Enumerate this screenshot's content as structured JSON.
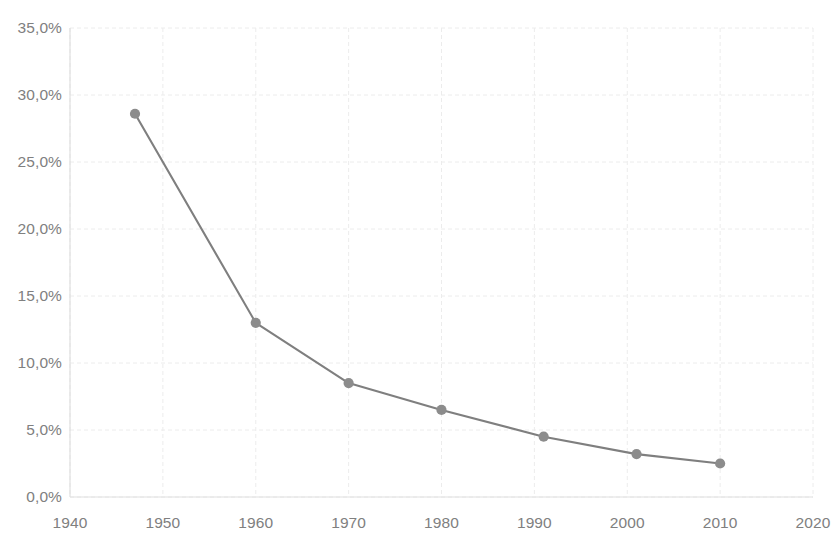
{
  "chart_data": {
    "type": "line",
    "title": "",
    "subtitle": "",
    "xlabel": "",
    "ylabel": "",
    "x": [
      1947,
      1960,
      1970,
      1980,
      1991,
      2001,
      2010
    ],
    "values": [
      28.6,
      13.0,
      8.5,
      6.5,
      4.5,
      3.2,
      2.5
    ],
    "series": [
      {
        "name": "",
        "x": [
          1947,
          1960,
          1970,
          1980,
          1991,
          2001,
          2010
        ],
        "values": [
          28.6,
          13.0,
          8.5,
          6.5,
          4.5,
          3.2,
          2.5
        ]
      }
    ],
    "xlim": [
      1940,
      2020
    ],
    "ylim": [
      0,
      35
    ],
    "x_tick_labels": [
      "1940",
      "1950",
      "1960",
      "1970",
      "1980",
      "1990",
      "2000",
      "2010",
      "2020"
    ],
    "x_tick_values": [
      1940,
      1950,
      1960,
      1970,
      1980,
      1990,
      2000,
      2010,
      2020
    ],
    "y_tick_labels": [
      "0,0%",
      "5,0%",
      "10,0%",
      "15,0%",
      "20,0%",
      "25,0%",
      "30,0%",
      "35,0%"
    ],
    "y_tick_values": [
      0,
      5,
      10,
      15,
      20,
      25,
      30,
      35
    ],
    "grid": true,
    "grid_style": "dashed",
    "legend": false,
    "legend_position": "none",
    "annotations": [],
    "colors": {
      "line": "#7f7f7f",
      "marker": "#8c8c8c",
      "grid": "#ececec",
      "axis": "#e0e0e0",
      "tick_text": "#808080",
      "background": "#ffffff"
    }
  }
}
